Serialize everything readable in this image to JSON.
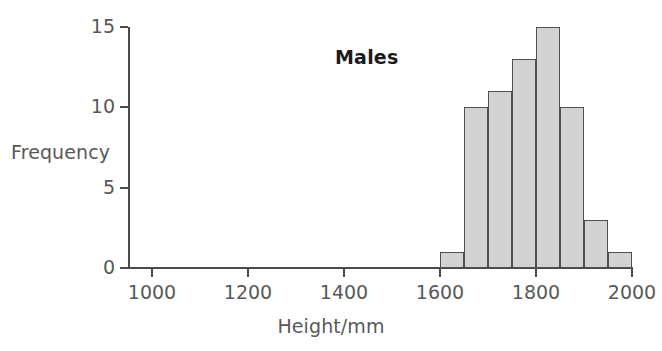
{
  "chart_data": {
    "type": "bar",
    "title": "Males",
    "xlabel": "Height/mm",
    "ylabel": "Frequency",
    "xlim": [
      950,
      2000
    ],
    "ylim": [
      0,
      15
    ],
    "grid": false,
    "legend": "none",
    "bin_width": 50,
    "x_ticks": [
      1000,
      1200,
      1400,
      1600,
      1800,
      2000
    ],
    "x_tick_labels": [
      "1000",
      "1200",
      "1400",
      "1600",
      "1800",
      "2000"
    ],
    "y_ticks": [
      0,
      5,
      10,
      15
    ],
    "y_tick_labels": [
      "0",
      "5",
      "10",
      "15"
    ],
    "categories": [
      "1600-1650",
      "1650-1700",
      "1700-1750",
      "1750-1800",
      "1800-1850",
      "1850-1900",
      "1900-1950",
      "1950-2000"
    ],
    "bin_edges": [
      1600,
      1650,
      1700,
      1750,
      1800,
      1850,
      1900,
      1950,
      2000
    ],
    "values": [
      1,
      10,
      11,
      13,
      15,
      10,
      3,
      1
    ],
    "bar_fill_color": "#d2d2d2",
    "bar_edge_color": "#4f4f51",
    "axis_color": "#4a4a4c",
    "text_color": "#58585a",
    "title_color": "#1b1b1b"
  }
}
